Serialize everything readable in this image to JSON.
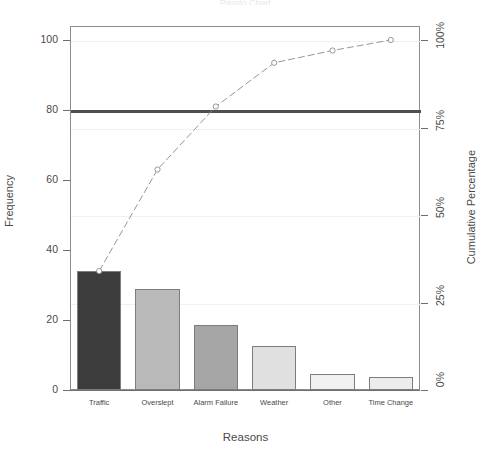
{
  "chart_data": {
    "type": "bar",
    "title": "Pareto Chart",
    "xlabel": "Reasons",
    "ylabel": "Frequency",
    "y2label": "Cumulative Percentage",
    "categories": [
      "Traffic",
      "Overslept",
      "Alarm Failure",
      "Weather",
      "Other",
      "Time Change"
    ],
    "values": [
      34,
      29,
      18.5,
      12.7,
      4.5,
      3.8
    ],
    "cumulative_percent": [
      34,
      63,
      81,
      93.5,
      97,
      100
    ],
    "ylim": [
      0,
      104
    ],
    "y2lim": [
      0,
      104
    ],
    "yticks": [
      "0",
      "20",
      "40",
      "60",
      "80",
      "100"
    ],
    "ytick_values": [
      0,
      20,
      40,
      60,
      80,
      100
    ],
    "y2ticks": [
      "0%",
      "25%",
      "50%",
      "75%",
      "100%"
    ],
    "y2tick_values": [
      0,
      25,
      50,
      75,
      100
    ],
    "grid": true,
    "gridlines_at": [
      25,
      50,
      75,
      100
    ],
    "reference_line": {
      "value": 80,
      "label": "80% reference line",
      "color": "#4f4f4f"
    },
    "legend": "none",
    "bar_colors": [
      "#3c3c3c",
      "#b9b9b9",
      "#a5a5a5",
      "#e0e0e0",
      "#f0f0f0",
      "#ececec"
    ],
    "bar_border_color": "#7d7d7d",
    "line_color": "#8a8a8a",
    "marker": "open-circle",
    "marker_color": "#8a8a8a",
    "background": "#ffffff",
    "axis_color": "#6f6f6f"
  }
}
